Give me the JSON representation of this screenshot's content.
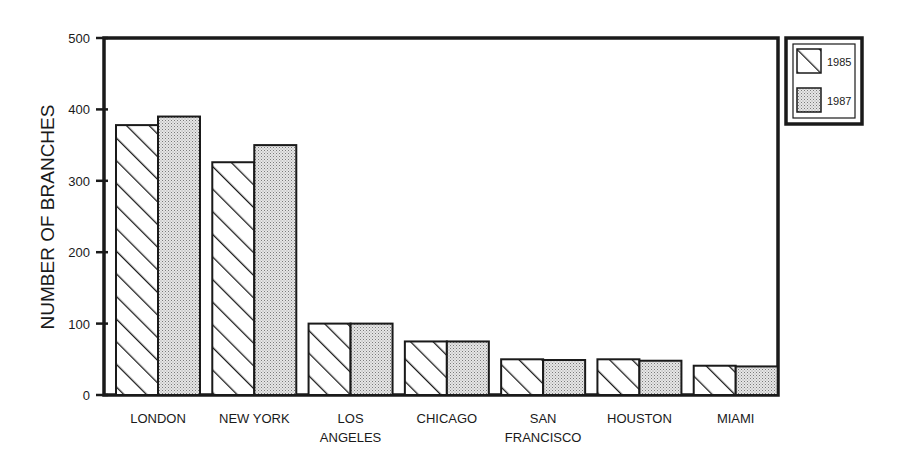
{
  "chart_data": {
    "type": "bar",
    "title": "",
    "xlabel": "",
    "ylabel": "NUMBER OF BRANCHES",
    "ylim": [
      0,
      500
    ],
    "yticks": [
      0,
      100,
      200,
      300,
      400,
      500
    ],
    "grid": false,
    "legend_position": "right-top",
    "categories": [
      "LONDON",
      "NEW YORK",
      "LOS ANGELES",
      "CHICAGO",
      "SAN FRANCISCO",
      "HOUSTON",
      "MIAMI"
    ],
    "category_lines": [
      [
        "LONDON"
      ],
      [
        "NEW YORK"
      ],
      [
        "LOS",
        "ANGELES"
      ],
      [
        "CHICAGO"
      ],
      [
        "SAN",
        "FRANCISCO"
      ],
      [
        "HOUSTON"
      ],
      [
        "MIAMI"
      ]
    ],
    "series": [
      {
        "name": "1985",
        "pattern": "diagonal-hatch",
        "values": [
          378,
          326,
          100,
          75,
          50,
          50,
          41
        ]
      },
      {
        "name": "1987",
        "pattern": "stipple",
        "values": [
          390,
          350,
          100,
          75,
          49,
          48,
          40
        ]
      }
    ]
  },
  "legend": {
    "items": [
      {
        "label": "1985"
      },
      {
        "label": "1987"
      }
    ]
  },
  "colors": {
    "ink": "#1a1a1a",
    "stipple": "#c8c8c8",
    "background": "#ffffff"
  }
}
